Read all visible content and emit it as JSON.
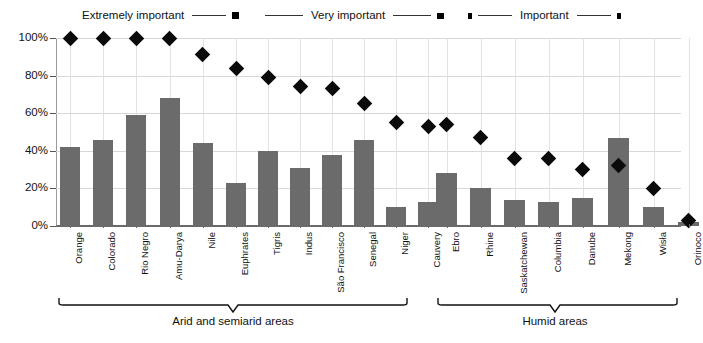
{
  "chart_data": {
    "type": "bar",
    "title": "",
    "xlabel": "",
    "ylabel": "",
    "ylim": [
      0,
      100
    ],
    "ytick_labels": [
      "100%",
      "80%",
      "60%",
      "40%",
      "20%",
      "0%"
    ],
    "ytick_values": [
      100,
      80,
      60,
      40,
      20,
      0
    ],
    "grid": true,
    "legend_position": "top",
    "legend": [
      {
        "name": "Extremely important",
        "marker": "diamond"
      },
      {
        "name": "Very important",
        "marker": "square"
      },
      {
        "name": "Important",
        "marker": "small-square"
      }
    ],
    "categories": [
      "Orange",
      "Colorado",
      "Rio Negro",
      "Amu-Darya",
      "Nile",
      "Euphrates",
      "Tigris",
      "Indus",
      "São Francisco",
      "Senegal",
      "Niger",
      "Cauvery",
      "Ebro",
      "Rhine",
      "Saskatchewan",
      "Columbia",
      "Danube",
      "Mekong",
      "Wisła",
      "Orinoco"
    ],
    "series": [
      {
        "name": "bars",
        "marker": "bar",
        "values": [
          42,
          46,
          59,
          68,
          44,
          23,
          40,
          31,
          38,
          46,
          10,
          13,
          28,
          20,
          14,
          13,
          15,
          47,
          10,
          2
        ]
      },
      {
        "name": "markers",
        "marker": "diamond",
        "values": [
          100,
          100,
          100,
          100,
          91,
          84,
          79,
          74,
          73,
          65,
          55,
          53,
          54,
          47,
          36,
          36,
          30,
          32,
          20,
          3
        ]
      }
    ],
    "groups": [
      {
        "label": "",
        "categories": [
          "Orange",
          "Colorado",
          "Rio Negro",
          "Amu-Darya",
          "Nile"
        ]
      },
      {
        "label": "",
        "categories": [
          "Euphrates",
          "Tigris",
          "Indus",
          "São Francisco",
          "Senegal",
          "Niger",
          "Cauvery"
        ]
      },
      {
        "label": "",
        "categories": [
          "Ebro",
          "Rhine",
          "Saskatchewan",
          "Columbia",
          "Danube"
        ]
      },
      {
        "label": "",
        "categories": [
          "Mekong",
          "Wisła",
          "Orinoco"
        ]
      }
    ],
    "annotations": [
      {
        "text": "Arid and semiarid areas",
        "type": "bracket",
        "span": [
          "Orange",
          "Cauvery"
        ]
      },
      {
        "text": "Humid areas",
        "type": "bracket",
        "span": [
          "Ebro",
          "Orinoco"
        ]
      }
    ],
    "colors": {
      "bar": "#6b6b6b",
      "marker": "#0a0a0a",
      "grid": "#d8d8d8",
      "axis": "#6a6a6a",
      "text": "#111111",
      "background": "#ffffff"
    }
  }
}
